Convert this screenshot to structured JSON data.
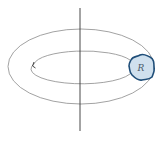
{
  "diagram": {
    "type": "solid-of-revolution-torus",
    "region_label": "R",
    "colors": {
      "outline": "#8a8a8a",
      "axis": "#333333",
      "region_fill": "#cfe0ee",
      "region_stroke": "#1f4e79",
      "label": "#4a5a6a"
    },
    "axis": {
      "x": 80,
      "y1": 8,
      "y2": 131
    },
    "outer_ellipse": {
      "cx": 81,
      "cy": 66.5,
      "rx": 73,
      "ry": 37.5
    },
    "inner_ellipse": {
      "cx": 82,
      "cy": 66.5,
      "rx": 50,
      "ry": 14.5
    },
    "region": {
      "cx": 142,
      "cy": 67,
      "label_x": 142,
      "label_y": 70
    }
  }
}
